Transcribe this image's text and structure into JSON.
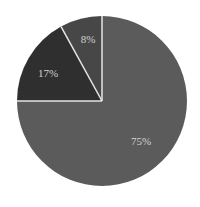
{
  "chart_data": {
    "type": "pie",
    "title": "",
    "start_angle_deg": 0,
    "direction": "clockwise",
    "legend": "none",
    "slices": [
      {
        "label": "75%",
        "value": 75,
        "color": "#5b5b5b",
        "label_pos": [
          141,
          142
        ]
      },
      {
        "label": "17%",
        "value": 17,
        "color": "#2f2f2f",
        "label_pos": [
          48,
          74
        ]
      },
      {
        "label": "8%",
        "value": 8,
        "color": "#474747",
        "label_pos": [
          88,
          40
        ]
      }
    ],
    "separator_color": "#e6e6e6",
    "center": [
      102,
      101
    ],
    "radius": 85
  }
}
